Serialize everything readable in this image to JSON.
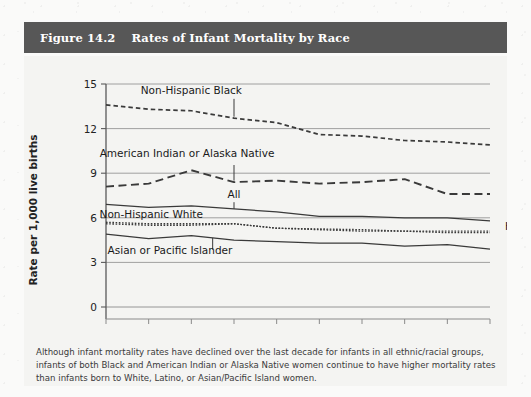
{
  "figure": {
    "number": "Figure 14.2",
    "title": "Rates of Infant Mortality by Race",
    "header_bg": "#575757",
    "header_text_color": "#ffffff",
    "panel_bg": "#f4f4f2"
  },
  "caption": {
    "text": "Although infant mortality rates have declined over the last decade for infants in all ethnic/racial groups, infants of both Black and American Indian or Alaska Native women continue to have higher mortality rates than infants born to White, Latino, or Asian/Pacific Island women."
  },
  "chart_data": {
    "type": "line",
    "title": "Rates of Infant Mortality by Race",
    "xlabel": "",
    "ylabel": "Rate per 1,000 live births",
    "x": [
      "2005",
      "2006",
      "2007",
      "2008",
      "2009",
      "2010",
      "2011",
      "2012",
      "2013",
      "2014"
    ],
    "categories": [
      "2005",
      "2006",
      "2007",
      "2008",
      "2009",
      "2010",
      "2011",
      "2012",
      "2013",
      "2014"
    ],
    "ylim": [
      0,
      15
    ],
    "yticks": [
      0,
      3,
      6,
      9,
      12,
      15
    ],
    "ytick_labels": [
      "0",
      "3",
      "6",
      "9",
      "12",
      "15"
    ],
    "grid": true,
    "legend_position": "inline-annotations",
    "series": [
      {
        "name": "Non-Hispanic Black",
        "style": "dashed",
        "color": "#3a3a3a",
        "values": [
          13.6,
          13.3,
          13.2,
          12.7,
          12.4,
          11.6,
          11.5,
          11.2,
          11.1,
          10.9
        ],
        "label": "Non-Hispanic Black",
        "label_x": 2007.0,
        "label_y": 14.35,
        "leader_x": 2008.0,
        "leader_from_y": 14.0,
        "leader_to_y": 12.8
      },
      {
        "name": "American Indian or Alaska Native",
        "style": "long-dashed",
        "color": "#3a3a3a",
        "values": [
          8.1,
          8.3,
          9.2,
          8.4,
          8.5,
          8.3,
          8.4,
          8.6,
          7.6,
          7.6
        ],
        "label": "American Indian or Alaska Native",
        "label_x": 2006.9,
        "label_y": 10.1,
        "leader_x": 2008.0,
        "leader_from_y": 9.55,
        "leader_to_y": 8.5
      },
      {
        "name": "All",
        "style": "solid",
        "color": "#3a3a3a",
        "values": [
          6.9,
          6.7,
          6.8,
          6.6,
          6.4,
          6.1,
          6.1,
          6.0,
          6.0,
          5.8
        ],
        "label": "All",
        "label_x": 2008.0,
        "label_y": 7.35,
        "leader_x": 2008.0,
        "leader_from_y": 7.05,
        "leader_to_y": 6.6
      },
      {
        "name": "Non-Hispanic White",
        "style": "fine-dotted",
        "color": "#3a3a3a",
        "values": [
          5.7,
          5.6,
          5.6,
          5.6,
          5.3,
          5.2,
          5.1,
          5.1,
          5.1,
          5.1
        ],
        "label": "Non-Hispanic White",
        "label_x": 2004.85,
        "label_y": 6.0,
        "leader_x": null,
        "leader_from_y": null,
        "leader_to_y": null
      },
      {
        "name": "Hispanic",
        "style": "fine-dotted",
        "color": "#3a3a3a",
        "values": [
          5.6,
          5.5,
          5.5,
          5.6,
          5.3,
          5.25,
          5.2,
          5.1,
          5.0,
          5.0
        ],
        "label": "Hispanic",
        "label_x": 2014.35,
        "label_y": 5.15,
        "leader_x": null,
        "leader_from_y": null,
        "leader_to_y": null
      },
      {
        "name": "Asian or Pacific Islander",
        "style": "solid",
        "color": "#3a3a3a",
        "values": [
          4.9,
          4.6,
          4.8,
          4.5,
          4.4,
          4.3,
          4.3,
          4.1,
          4.2,
          3.9
        ],
        "label": "Asian or Pacific Islander",
        "label_x": 2006.5,
        "label_y": 3.55,
        "leader_x": 2007.5,
        "leader_from_y": 3.85,
        "leader_to_y": 4.65
      }
    ]
  }
}
